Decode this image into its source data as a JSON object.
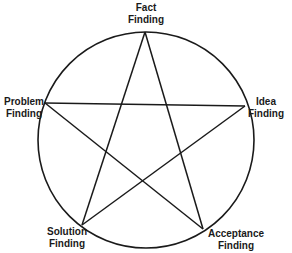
{
  "diagram": {
    "type": "pentagram-in-circle",
    "stroke_color": "#1a1a1a",
    "background_color": "#ffffff",
    "nodes": [
      {
        "id": "fact",
        "line1": "Fact",
        "line2": "Finding"
      },
      {
        "id": "idea",
        "line1": "Idea",
        "line2": "Finding"
      },
      {
        "id": "acceptance",
        "line1": "Acceptance",
        "line2": "Finding"
      },
      {
        "id": "solution",
        "line1": "Solution",
        "line2": "Finding"
      },
      {
        "id": "problem",
        "line1": "Problem",
        "line2": "Finding"
      }
    ],
    "edges": [
      [
        "fact",
        "acceptance"
      ],
      [
        "acceptance",
        "problem"
      ],
      [
        "problem",
        "idea"
      ],
      [
        "idea",
        "solution"
      ],
      [
        "solution",
        "fact"
      ]
    ]
  }
}
